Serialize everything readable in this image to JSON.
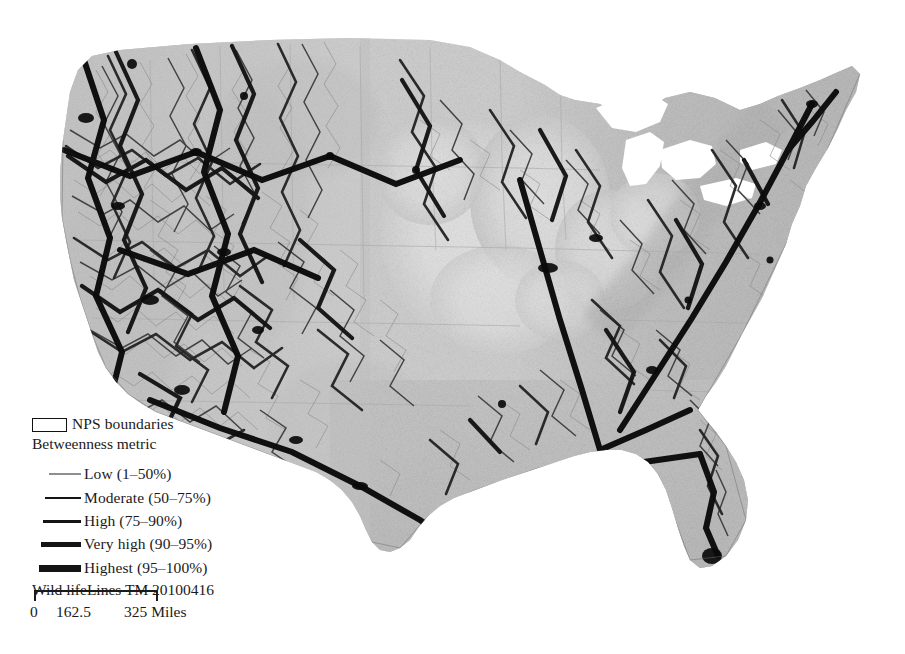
{
  "figure": {
    "kind": "thematic-map",
    "region": "Conterminous United States",
    "background_color": "#ffffff"
  },
  "map": {
    "name": "wild-lifelines-betweenness-map",
    "description": "Grayscale map of the conterminous United States showing a wildlife corridor network; line darkness and thickness encode the betweenness metric over a shaded terrain/permeability surface.",
    "fill_light": "#ffffff",
    "fill_mid": "#b9b9b9",
    "fill_dark": "#8a8a8a",
    "line_color": "#161616"
  },
  "legend": {
    "nps": {
      "label": "NPS boundaries",
      "swatch": "open-rectangle",
      "swatch_stroke": "#111111",
      "swatch_fill": "#ffffff"
    },
    "title": "Betweenness metric",
    "classes": [
      {
        "key": "low",
        "label": "Low (1–50%)",
        "swatch": "thin-line",
        "color": "#8e8e8e",
        "weight_px": 1.1
      },
      {
        "key": "moderate",
        "label": "Moderate (50–75%)",
        "swatch": "medium-line",
        "color": "#141414",
        "weight_px": 2.1
      },
      {
        "key": "high",
        "label": "High (75–90%)",
        "swatch": "thick-line",
        "color": "#141414",
        "weight_px": 3.4
      },
      {
        "key": "veryhigh",
        "label": "Very high (90–95%)",
        "swatch": "thicker-line",
        "color": "#141414",
        "weight_px": 4.6
      },
      {
        "key": "highest",
        "label": "Highest (95–100%)",
        "swatch": "thickest-line",
        "color": "#141414",
        "weight_px": 6.2
      }
    ],
    "credit": "Wild lifeLines TM 20100416"
  },
  "scalebar": {
    "name": "distance-scale",
    "labels": {
      "min": "0",
      "mid": "162.5",
      "max": "325 Miles"
    },
    "units": "Miles",
    "values": [
      0,
      162.5,
      325
    ]
  }
}
